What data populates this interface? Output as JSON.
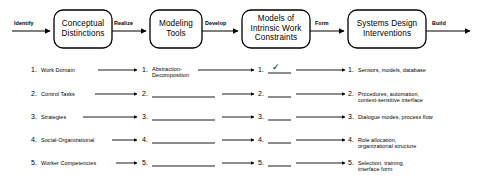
{
  "diagram": {
    "stroke_color": "#000000",
    "background_color": "#ffffff",
    "flow": {
      "boxes": [
        {
          "label": "Conceptual\nDistinctions"
        },
        {
          "label": "Modeling\nTools"
        },
        {
          "label": "Models of\nIntrinsic Work\nConstraints"
        },
        {
          "label": "Systems Design\nInterventions"
        }
      ],
      "edge_labels": [
        {
          "label": "Identify"
        },
        {
          "label": "Realize"
        },
        {
          "label": "Develop"
        },
        {
          "label": "Form"
        },
        {
          "label": "Build"
        }
      ]
    },
    "columns": {
      "numbers": [
        "1.",
        "2.",
        "3.",
        "4.",
        "5."
      ],
      "column1": {
        "items": [
          "Work Domain",
          "Control Tasks",
          "Strategies",
          "Social-Organizational",
          "Worker Competencies"
        ]
      },
      "column2": {
        "items": [
          "Abstraction-\nDecomposition",
          "",
          "",
          "",
          ""
        ]
      },
      "column3": {
        "items": [
          "",
          "",
          "",
          "",
          ""
        ],
        "checkmark": "✓",
        "checkmark_row": 1
      },
      "column4": {
        "items": [
          "Sensors, models, database",
          "Procedures, automation,\ncontext-sensitive interface",
          "Dialogue modes, process flow",
          "Role allocation,\norganizational structure",
          "Selection, training,\ninterface form"
        ]
      }
    }
  }
}
